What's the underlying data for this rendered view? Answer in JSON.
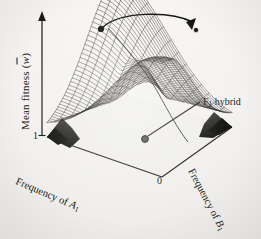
{
  "figure": {
    "kind": "3d-adaptive-landscape",
    "background_color": "#f3f2f0",
    "ink_color": "#16150f",
    "caption_present": false
  },
  "axes": {
    "vertical": {
      "title_text": "Mean fitness (",
      "title_symbol": "w",
      "title_suffix": ")",
      "overbar": true,
      "arrow": "up",
      "tick_label": "1"
    },
    "left_base": {
      "title_prefix": "Frequency of ",
      "title_symbol": "A",
      "title_subscript": "1",
      "tick_label": "1"
    },
    "right_base": {
      "title_prefix": "Frequency of ",
      "title_symbol": "B",
      "title_subscript": "1",
      "tick_label": "1"
    },
    "origin": {
      "tick_label": "0"
    }
  },
  "annotations": {
    "f1_hybrid": {
      "label_prefix": "F",
      "label_subscript": "1",
      "label_suffix": " hybrid",
      "marker": "dot-on-saddle"
    },
    "transition_arrow": {
      "description": "curved arrow joining the two fitness peaks",
      "head": "right"
    },
    "peaks": [
      {
        "name": "peak-left",
        "label": ""
      },
      {
        "name": "peak-right",
        "label": ""
      }
    ]
  },
  "chart_data": {
    "type": "surface",
    "title": "",
    "xlabel": "Frequency of A1",
    "ylabel": "Frequency of B1",
    "zlabel": "Mean fitness (w-bar)",
    "xlim": [
      0,
      1
    ],
    "ylim": [
      0,
      1
    ],
    "zlim": [
      0,
      1
    ],
    "grid": false,
    "legend": "none",
    "mesh": {
      "rows": 46,
      "cols": 46,
      "style": "wireframe-lines"
    },
    "features": [
      {
        "name": "peak-A1B1",
        "x": 1.0,
        "y": 1.0,
        "z": 1.0
      },
      {
        "name": "peak-A2B2",
        "x": 0.0,
        "y": 0.0,
        "z": 1.0
      },
      {
        "name": "saddle-F1-hybrid",
        "x": 0.5,
        "y": 0.5,
        "z": 0.45
      },
      {
        "name": "valley-A1B2",
        "x": 1.0,
        "y": 0.0,
        "z": 0.05
      },
      {
        "name": "valley-A2B1",
        "x": 0.0,
        "y": 1.0,
        "z": 0.05
      }
    ]
  }
}
